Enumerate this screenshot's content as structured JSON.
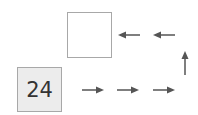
{
  "diagram": {
    "start_value": "24",
    "answer_value": "",
    "colors": {
      "start_box_fill": "#ececec",
      "box_border": "#a8a8a8",
      "arrow": "#555555",
      "text": "#333333"
    },
    "path": [
      {
        "direction": "right",
        "icon": "arrow-right-icon"
      },
      {
        "direction": "right",
        "icon": "arrow-right-icon"
      },
      {
        "direction": "right",
        "icon": "arrow-right-icon"
      },
      {
        "direction": "up",
        "icon": "arrow-up-icon"
      },
      {
        "direction": "left",
        "icon": "arrow-left-icon"
      },
      {
        "direction": "left",
        "icon": "arrow-left-icon"
      }
    ]
  }
}
